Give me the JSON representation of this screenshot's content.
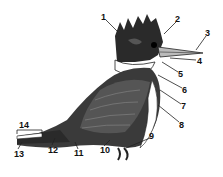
{
  "diagram": {
    "labels": [
      {
        "id": "1",
        "text": "1",
        "x": 101,
        "y": 13
      },
      {
        "id": "2",
        "text": "2",
        "x": 175,
        "y": 15
      },
      {
        "id": "3",
        "text": "3",
        "x": 205,
        "y": 29
      },
      {
        "id": "4",
        "text": "4",
        "x": 197,
        "y": 57
      },
      {
        "id": "5",
        "text": "5",
        "x": 178,
        "y": 70
      },
      {
        "id": "6",
        "text": "6",
        "x": 182,
        "y": 86
      },
      {
        "id": "7",
        "text": "7",
        "x": 181,
        "y": 102
      },
      {
        "id": "8",
        "text": "8",
        "x": 179,
        "y": 121
      },
      {
        "id": "9",
        "text": "9",
        "x": 149,
        "y": 132
      },
      {
        "id": "10",
        "text": "10",
        "x": 100,
        "y": 146
      },
      {
        "id": "11",
        "text": "11",
        "x": 74,
        "y": 149
      },
      {
        "id": "12",
        "text": "12",
        "x": 48,
        "y": 146
      },
      {
        "id": "13",
        "text": "13",
        "x": 14,
        "y": 150
      },
      {
        "id": "14",
        "text": "14",
        "x": 19,
        "y": 121
      }
    ]
  }
}
